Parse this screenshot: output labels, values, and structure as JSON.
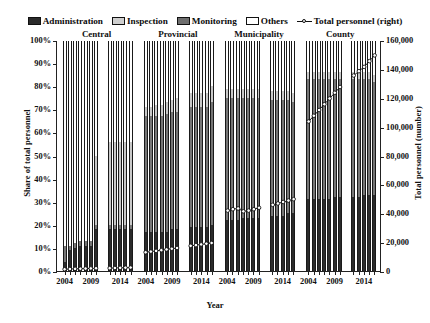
{
  "legend": {
    "items": [
      {
        "label": "Administration",
        "kind": "swatch",
        "color": "#2b2b2b"
      },
      {
        "label": "Inspection",
        "kind": "swatch",
        "color": "#cfcfcf"
      },
      {
        "label": "Monitoring",
        "kind": "swatch",
        "color": "#6e6e6e"
      },
      {
        "label": "Others",
        "kind": "swatch",
        "color": "#ffffff"
      },
      {
        "label": "Total personnel (right)",
        "kind": "line",
        "color": "#111111"
      }
    ]
  },
  "chart_data": {
    "type": "bar",
    "subtype": "stacked-100-percent-with-line-overlay",
    "title": "",
    "xlabel": "Year",
    "ylabel": "Share of total personnel",
    "ylabel_right": "Total personnel (number)",
    "ylim": [
      0,
      100
    ],
    "yticks": [
      "0%",
      "10%",
      "20%",
      "30%",
      "40%",
      "50%",
      "60%",
      "70%",
      "80%",
      "90%",
      "100%"
    ],
    "ylim_right": [
      0,
      160000
    ],
    "yticks_right": [
      "0",
      "20,000",
      "40,000",
      "60,000",
      "80,000",
      "100,000",
      "120,000",
      "140,000",
      "160,000"
    ],
    "xticks": [
      "2004",
      "2009",
      "2014"
    ],
    "grid": false,
    "legend_position": "top",
    "series_names": [
      "Administration",
      "Inspection",
      "Monitoring",
      "Others"
    ],
    "line_series_name": "Total personnel (right)",
    "panels": [
      {
        "name": "Central",
        "years": [
          2004,
          2005,
          2006,
          2007,
          2008,
          2009,
          2010,
          2012,
          2013,
          2014,
          2015,
          2016
        ],
        "gap_after_index": 6,
        "administration": [
          4,
          9,
          10,
          11,
          11,
          11,
          18,
          18,
          18,
          18,
          18,
          18
        ],
        "monitoring": [
          7,
          2,
          2,
          2,
          2,
          2,
          2,
          2,
          2,
          2,
          2,
          2
        ],
        "inspection": [
          0,
          0,
          0,
          0,
          0,
          0,
          30,
          36,
          36,
          36,
          36,
          36
        ],
        "others": [
          89,
          89,
          88,
          87,
          87,
          87,
          50,
          44,
          44,
          44,
          44,
          44
        ],
        "total_personnel": [
          1200,
          1400,
          1500,
          1600,
          1700,
          1800,
          1900,
          2000,
          2100,
          2200,
          2300,
          2400
        ]
      },
      {
        "name": "Provincial",
        "years": [
          2004,
          2005,
          2006,
          2007,
          2008,
          2009,
          2010,
          2012,
          2013,
          2014,
          2015,
          2016
        ],
        "gap_after_index": 6,
        "administration": [
          17,
          17,
          17,
          17,
          17,
          18,
          18,
          19,
          19,
          19,
          19,
          20
        ],
        "monitoring": [
          50,
          50,
          50,
          50,
          51,
          51,
          51,
          52,
          52,
          52,
          52,
          53
        ],
        "inspection": [
          4,
          4,
          5,
          5,
          5,
          5,
          6,
          6,
          6,
          6,
          6,
          7
        ],
        "others": [
          29,
          29,
          28,
          28,
          27,
          26,
          25,
          23,
          23,
          23,
          23,
          20
        ],
        "total_personnel": [
          13000,
          13500,
          14000,
          14500,
          15000,
          15500,
          16000,
          17500,
          18000,
          18500,
          19000,
          19500
        ]
      },
      {
        "name": "Municipality",
        "years": [
          2004,
          2005,
          2006,
          2007,
          2008,
          2009,
          2010,
          2012,
          2013,
          2014,
          2015,
          2016
        ],
        "gap_after_index": 6,
        "administration": [
          22,
          22,
          22,
          23,
          23,
          23,
          23,
          24,
          24,
          24,
          25,
          25
        ],
        "monitoring": [
          53,
          53,
          53,
          52,
          52,
          52,
          52,
          50,
          50,
          50,
          49,
          48
        ],
        "inspection": [
          4,
          4,
          4,
          4,
          4,
          4,
          4,
          4,
          4,
          4,
          4,
          4
        ],
        "others": [
          21,
          21,
          21,
          21,
          21,
          21,
          21,
          22,
          22,
          22,
          22,
          23
        ],
        "total_personnel": [
          42000,
          43000,
          43500,
          41500,
          42000,
          43000,
          44000,
          46000,
          47000,
          48000,
          49000,
          50000
        ]
      },
      {
        "name": "County",
        "years": [
          2004,
          2005,
          2006,
          2007,
          2008,
          2009,
          2010,
          2012,
          2013,
          2014,
          2015,
          2016
        ],
        "gap_after_index": 6,
        "administration": [
          31,
          31,
          31,
          31,
          31,
          32,
          32,
          32,
          32,
          33,
          33,
          33
        ],
        "monitoring": [
          52,
          52,
          52,
          52,
          52,
          51,
          51,
          51,
          51,
          50,
          50,
          49
        ],
        "inspection": [
          3,
          3,
          3,
          3,
          3,
          3,
          3,
          3,
          3,
          3,
          3,
          3
        ],
        "others": [
          14,
          14,
          14,
          14,
          14,
          14,
          14,
          14,
          14,
          14,
          14,
          15
        ],
        "total_personnel": [
          104000,
          108000,
          112000,
          116000,
          120000,
          124000,
          128000,
          136000,
          139000,
          142000,
          146000,
          150000
        ]
      }
    ]
  }
}
